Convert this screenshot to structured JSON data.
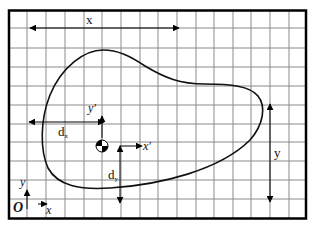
{
  "figure": {
    "colors": {
      "background": "#ffffff",
      "grid": "#8a8a8a",
      "frame": "#000000",
      "curve": "#111111"
    },
    "labels": {
      "global_x_dim": "x",
      "global_y_dim": "y",
      "dx": "d",
      "dx_sub": "x",
      "dy": "d",
      "dy_sub": "y",
      "local_x_axis": "x′",
      "local_y_axis": "y′",
      "origin": "O",
      "origin_x_axis": "x",
      "origin_y_axis": "y"
    },
    "elements": [
      "grid",
      "outer-frame",
      "closed-area-outline",
      "centroid-symbol",
      "x-dimension-arrow",
      "y-dimension-arrow",
      "dx-arrow",
      "dy-arrow",
      "local-axes",
      "global-origin-axes"
    ]
  }
}
